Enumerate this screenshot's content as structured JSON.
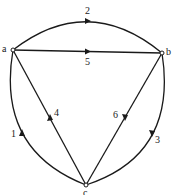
{
  "diagram": {
    "type": "directed-multigraph",
    "colors": {
      "stroke": "#1a1a1a",
      "background": "#ffffff"
    },
    "nodes": [
      {
        "id": "a",
        "label": "a"
      },
      {
        "id": "b",
        "label": "b"
      },
      {
        "id": "c",
        "label": "c"
      }
    ],
    "edges": [
      {
        "id": "1",
        "label": "1",
        "from": "c",
        "to": "a",
        "shape": "arc-left"
      },
      {
        "id": "2",
        "label": "2",
        "from": "a",
        "to": "b",
        "shape": "arc-top"
      },
      {
        "id": "3",
        "label": "3",
        "from": "b",
        "to": "c",
        "shape": "arc-right"
      },
      {
        "id": "4",
        "label": "4",
        "from": "c",
        "to": "a",
        "shape": "straight"
      },
      {
        "id": "5",
        "label": "5",
        "from": "a",
        "to": "b",
        "shape": "straight"
      },
      {
        "id": "6",
        "label": "6",
        "from": "b",
        "to": "c",
        "shape": "straight"
      }
    ]
  }
}
